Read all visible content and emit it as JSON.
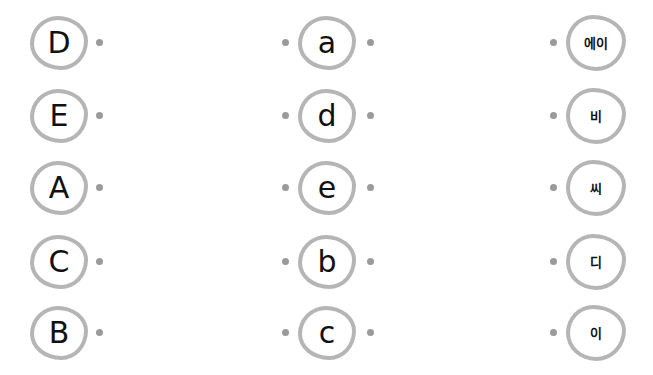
{
  "instructions_hidden": false,
  "column_uppercase": {
    "items": [
      "D",
      "E",
      "A",
      "C",
      "B"
    ]
  },
  "column_lowercase": {
    "items": [
      "a",
      "d",
      "e",
      "b",
      "c"
    ]
  },
  "column_korean": {
    "items": [
      "에이",
      "비",
      "씨",
      "디",
      "이"
    ]
  },
  "colors": {
    "border": "#b5b5b5",
    "dot": "#9a9a9a",
    "text": "#111111"
  }
}
